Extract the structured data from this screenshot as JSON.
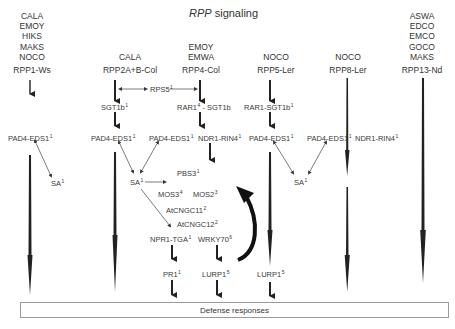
{
  "title": {
    "italic": "RPP",
    "rest": " signaling"
  },
  "columns": [
    {
      "id": "rpp1",
      "isolates": [
        "CALA",
        "EMOY",
        "HIKS",
        "MAKS",
        "NOCO"
      ],
      "gene": "RPP1-Ws"
    },
    {
      "id": "rpp2",
      "isolates": [
        "CALA"
      ],
      "gene": "RPP2A+B-Col"
    },
    {
      "id": "rpp4",
      "isolates": [
        "EMOY",
        "EMWA"
      ],
      "gene": "RPP4-Col"
    },
    {
      "id": "rpp5",
      "isolates": [
        "NOCO"
      ],
      "gene": "RPP5-Ler"
    },
    {
      "id": "rpp8",
      "isolates": [
        "NOCO"
      ],
      "gene": "RPP8-Ler"
    },
    {
      "id": "rpp13",
      "isolates": [
        "ASWA",
        "EDCO",
        "EMCO",
        "GOCO",
        "MAKS"
      ],
      "gene": "RPP13-Nd"
    }
  ],
  "nodes": {
    "rps5": {
      "text": "RPS5",
      "sup": "1"
    },
    "sgt1b": {
      "text": "SGT1b",
      "sup": "1"
    },
    "rar1_sgt1b_a": {
      "text": "RAR1",
      "sup": "4",
      "tail": " - SGT1b"
    },
    "rar1_sgt1b_b": {
      "text": "RAR1-SGT1b",
      "sup": "1"
    },
    "pad4_rpp1": {
      "text": "PAD4-EDS1",
      "sup": "1"
    },
    "pad4_rpp2": {
      "text": "PAD4-EDS1",
      "sup": "1"
    },
    "pad4_rpp4": {
      "text": "PAD4-EDS1",
      "sup": "1"
    },
    "ndr1_rpp4": {
      "text": "NDR1-RIN4",
      "sup": "1"
    },
    "pad4_rpp5": {
      "text": "PAD4-EDS1",
      "sup": "1"
    },
    "pad4_rpp8": {
      "text": "PAD4-EDS1",
      "sup": "1"
    },
    "ndr1_rpp8": {
      "text": "NDR1-RIN4",
      "sup": "1"
    },
    "sa_1": {
      "text": "SA",
      "sup": "1"
    },
    "sa_2": {
      "text": "SA",
      "sup": "1"
    },
    "sa_3": {
      "text": "SA",
      "sup": "1"
    },
    "pbs3": {
      "text": "PBS3",
      "sup": "1"
    },
    "mos3": {
      "text": "MOS3",
      "sup": "4"
    },
    "mos2": {
      "text": "MOS2",
      "sup": "3"
    },
    "atcngc11": {
      "text": "AtCNGC11",
      "sup": "2"
    },
    "atcngc12": {
      "text": "AtCNGC12",
      "sup": "2"
    },
    "npr1_tga": {
      "text": "NPR1-TGA",
      "sup": "1"
    },
    "wrky70": {
      "text": "WRKY70",
      "sup": "6"
    },
    "pr1": {
      "text": "PR1",
      "sup": "1"
    },
    "lurp1_a": {
      "text": "LURP1",
      "sup": "5"
    },
    "lurp1_b": {
      "text": "LURP1",
      "sup": "5"
    }
  },
  "defense": "Defense responses"
}
